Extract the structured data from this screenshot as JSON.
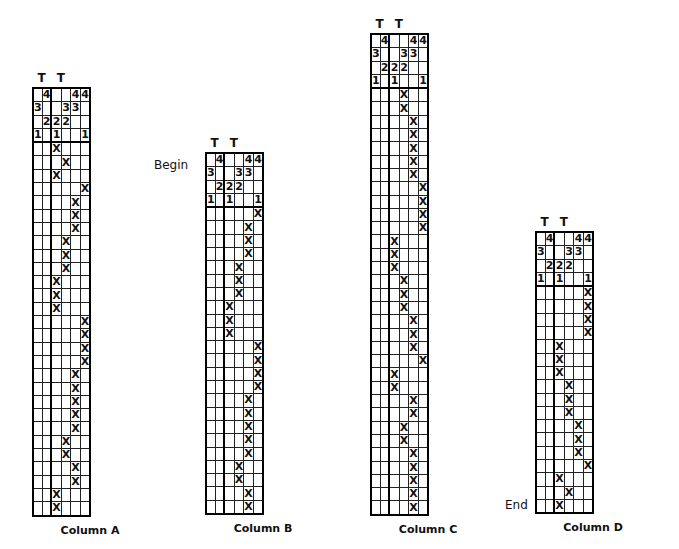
{
  "columns_count": 6,
  "symbols": {
    "mark": "X",
    "tablet_label": "T"
  },
  "header_rows": [
    [
      "",
      "4",
      "",
      "",
      "4",
      "4"
    ],
    [
      "3",
      "",
      "",
      "3",
      "3",
      ""
    ],
    [
      "",
      "2",
      "2",
      "2",
      "",
      ""
    ],
    [
      "1",
      "",
      "1",
      "",
      "",
      "1"
    ]
  ],
  "charts": [
    {
      "caption": "Column A",
      "side_label": "Begin",
      "t_labels": [
        "T",
        "T"
      ],
      "x_cols": [
        2,
        3,
        2,
        5,
        4,
        4,
        4,
        3,
        3,
        3,
        2,
        2,
        2,
        5,
        5,
        5,
        5,
        4,
        4,
        4,
        4,
        4,
        3,
        3,
        4,
        4,
        2,
        2
      ]
    },
    {
      "caption": "Column B",
      "side_label": "",
      "t_labels": [
        "T",
        "T"
      ],
      "x_cols": [
        5,
        4,
        4,
        4,
        3,
        3,
        3,
        2,
        2,
        2,
        5,
        5,
        5,
        5,
        4,
        4,
        4,
        4,
        4,
        3,
        3,
        4,
        4
      ]
    },
    {
      "caption": "Column C",
      "side_label": "",
      "t_labels": [
        "T",
        "T"
      ],
      "x_cols": [
        3,
        3,
        4,
        4,
        4,
        4,
        4,
        5,
        5,
        5,
        5,
        2,
        2,
        2,
        3,
        3,
        3,
        4,
        4,
        4,
        5,
        2,
        2,
        4,
        4,
        3,
        3,
        4,
        4,
        4,
        4,
        4
      ]
    },
    {
      "caption": "Column D",
      "side_label": "End",
      "t_labels": [
        "T",
        "T"
      ],
      "x_cols": [
        5,
        5,
        5,
        5,
        2,
        2,
        2,
        3,
        3,
        3,
        4,
        4,
        4,
        5,
        2,
        3,
        2
      ]
    }
  ]
}
